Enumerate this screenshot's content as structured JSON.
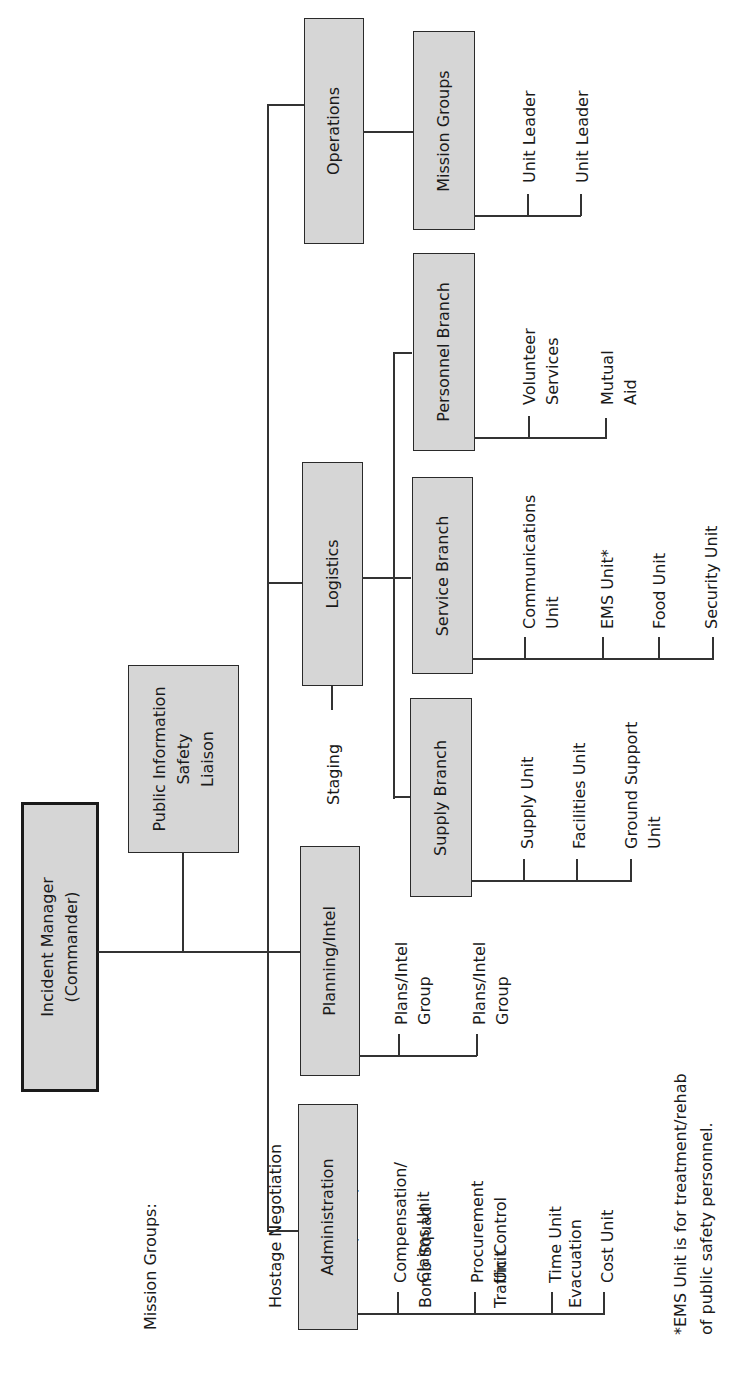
{
  "chart": {
    "root": {
      "label": "Incident Manager\n(Commander)"
    },
    "staff": {
      "label": "Public Information\nSafety\nLiaison"
    },
    "sections": {
      "operations": {
        "label": "Operations",
        "children": [
          {
            "label": "Mission Groups",
            "units": [
              "Unit Leader",
              "Unit Leader"
            ]
          }
        ]
      },
      "logistics": {
        "label": "Logistics",
        "staging": "Staging",
        "branches": [
          {
            "label": "Supply Branch",
            "units": [
              "Supply Unit",
              "Facilities Unit",
              "Ground Support\nUnit"
            ]
          },
          {
            "label": "Service Branch",
            "units": [
              "Communications\nUnit",
              "EMS Unit*",
              "Food Unit",
              "Security Unit"
            ]
          },
          {
            "label": "Personnel Branch",
            "units": [
              "Volunteer\nServices",
              "Mutual\nAid"
            ]
          }
        ]
      },
      "planning": {
        "label": "Planning/Intel",
        "units": [
          "Plans/Intel\nGroup",
          "Plans/Intel\nGroup"
        ]
      },
      "administration": {
        "label": "Administration",
        "units": [
          "Compensation/\nClaims Unit",
          "Procurement\nUnit",
          "Time Unit",
          "Cost Unit"
        ]
      }
    }
  },
  "mission_groups_note": {
    "title": "Mission Groups:",
    "items": [
      "Hostage Negotiation",
      "S.E.R.T. (SWAT)",
      "Bomb Squad",
      "Traffic Control",
      "Evacuation"
    ]
  },
  "footnote": "*EMS Unit is for treatment/rehab\nof public safety personnel."
}
